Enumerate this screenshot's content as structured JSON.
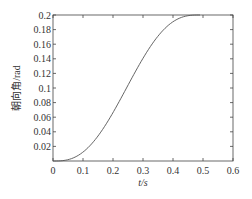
{
  "chart_data": {
    "type": "line",
    "title": "",
    "xlabel": "t/s",
    "ylabel": "朝向角/rad",
    "xlim": [
      0,
      0.6
    ],
    "ylim": [
      0,
      0.2
    ],
    "xticks": [
      0,
      0.1,
      0.2,
      0.3,
      0.4,
      0.5,
      0.6
    ],
    "xtick_labels": [
      "0",
      "0.1",
      "0.2",
      "0.3",
      "0.4",
      "0.5",
      "0.6"
    ],
    "yticks": [
      0.02,
      0.04,
      0.06,
      0.08,
      0.1,
      0.12,
      0.14,
      0.16,
      0.18,
      0.2
    ],
    "ytick_labels": [
      "0.02",
      "0.04",
      "0.06",
      "0.08",
      "0.1",
      "0.12",
      "0.14",
      "0.16",
      "0.18",
      "0.2"
    ],
    "grid": false,
    "legend": null,
    "series": [
      {
        "name": "heading angle",
        "color": "#555555",
        "x": [
          0,
          0.025,
          0.05,
          0.075,
          0.1,
          0.125,
          0.15,
          0.175,
          0.2,
          0.225,
          0.25,
          0.275,
          0.3,
          0.325,
          0.35,
          0.375,
          0.4,
          0.425,
          0.45,
          0.475,
          0.49
        ],
        "y": [
          0,
          0.0005,
          0.002,
          0.0045,
          0.0085,
          0.0135,
          0.0195,
          0.0265,
          0.0345,
          0.0435,
          0.053,
          0.0635,
          0.0745,
          0.086,
          0.098,
          0.11,
          0.1225,
          0.1345,
          0.146,
          0.1565,
          0.166
        ]
      }
    ]
  },
  "labels": {
    "xlabel": "t/s",
    "ylabel": "朝向角/rad"
  }
}
